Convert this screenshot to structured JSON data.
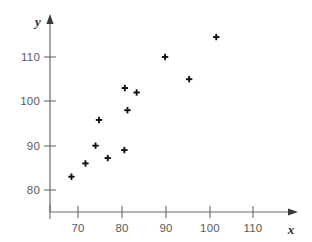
{
  "chart_data": {
    "type": "scatter",
    "title": "",
    "xlabel": "x",
    "ylabel": "y",
    "xlim": [
      63,
      120
    ],
    "ylim": [
      77,
      118
    ],
    "grid": false,
    "legend": null,
    "marker": "plus",
    "marker_color": "#111111",
    "xticks": [
      70,
      80,
      90,
      100,
      110
    ],
    "yticks": [
      80,
      90,
      100,
      110
    ],
    "xtick_labels": [
      "70",
      "80",
      "90",
      "100",
      "110"
    ],
    "ytick_labels": [
      "80",
      "90",
      "100",
      "110"
    ],
    "points": [
      {
        "x": 68.5,
        "y": 83
      },
      {
        "x": 71.7,
        "y": 86
      },
      {
        "x": 74.0,
        "y": 90
      },
      {
        "x": 74.8,
        "y": 95.8
      },
      {
        "x": 76.8,
        "y": 87.2
      },
      {
        "x": 80.6,
        "y": 89
      },
      {
        "x": 80.7,
        "y": 103
      },
      {
        "x": 81.3,
        "y": 98
      },
      {
        "x": 83.4,
        "y": 102
      },
      {
        "x": 89.9,
        "y": 110
      },
      {
        "x": 95.4,
        "y": 105
      },
      {
        "x": 101.6,
        "y": 114.5
      }
    ]
  },
  "axes": {
    "x_axis_name": "x",
    "y_axis_name": "y"
  }
}
